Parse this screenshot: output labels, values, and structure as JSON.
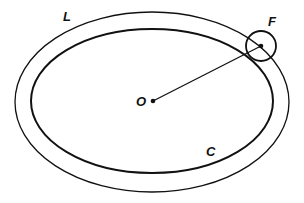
{
  "diagram": {
    "labels": {
      "L": "L",
      "F": "F",
      "O": "O",
      "C": "C"
    },
    "colors": {
      "stroke": "#111111",
      "background": "#ffffff"
    },
    "shapes": {
      "outer_ellipse": {
        "name": "L",
        "cx": 152,
        "cy": 102,
        "rx": 137,
        "ry": 90
      },
      "inner_ellipse": {
        "name": "C",
        "cx": 152,
        "cy": 101,
        "rx": 121,
        "ry": 72
      },
      "center_point": {
        "name": "O",
        "x": 153,
        "y": 101
      },
      "small_circle": {
        "name": "F",
        "cx": 261,
        "cy": 46,
        "r": 15
      },
      "radius_line": {
        "from": "O",
        "to": "F"
      }
    }
  }
}
